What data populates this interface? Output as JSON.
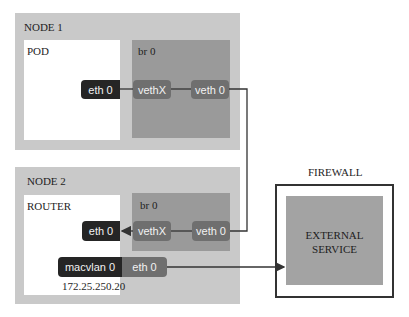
{
  "node1": {
    "title": "NODE 1",
    "pod": {
      "label": "POD",
      "iface": "eth 0"
    },
    "bridge": {
      "label": "br 0",
      "vethx": "vethX",
      "veth0": "veth 0"
    }
  },
  "node2": {
    "title": "NODE 2",
    "router": {
      "label": "ROUTER",
      "iface": "eth 0",
      "ip": "172.25.250.20"
    },
    "bridge": {
      "label": "br 0",
      "vethx": "vethX",
      "veth0": "veth 0"
    },
    "macvlan": {
      "label": "macvlan 0",
      "eth": "eth 0"
    }
  },
  "firewall": {
    "title": "FIREWALL",
    "service_line1": "EXTERNAL",
    "service_line2": "SERVICE"
  },
  "colors": {
    "node_bg": "#c9c9c9",
    "bridge_bg": "#9a9a9a",
    "pill_dark": "#252525",
    "pill_mid": "#6f6f6f",
    "line": "#333333"
  }
}
